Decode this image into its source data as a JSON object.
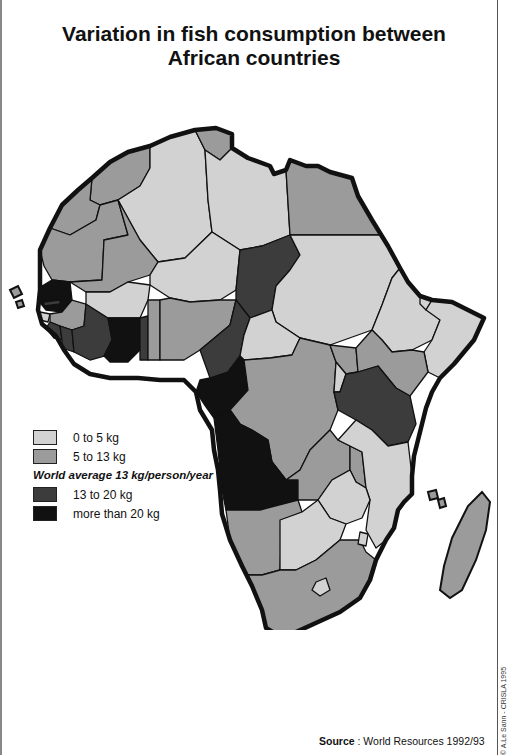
{
  "title": {
    "line1": "Variation in fish consumption between",
    "line2": "African countries"
  },
  "legend": {
    "items": [
      {
        "label": "0 to 5 kg",
        "category": "low",
        "color": "#d2d2d2"
      },
      {
        "label": "5 to 13 kg",
        "category": "mid",
        "color": "#9b9b9b"
      },
      {
        "label": "13 to 20 kg",
        "category": "high",
        "color": "#3c3c3c"
      },
      {
        "label": "more than 20 kg",
        "category": "very_high",
        "color": "#111111"
      }
    ],
    "world_average_note": "World average 13 kg/person/year"
  },
  "source": {
    "label": "Source",
    "text": " : World Resources 1992/93"
  },
  "credit": "© A.Le Sann - CRISLA 1995",
  "map": {
    "outline_color": "#111111",
    "regions": [
      {
        "name": "Morocco",
        "category": "mid"
      },
      {
        "name": "Algeria",
        "category": "low"
      },
      {
        "name": "Tunisia",
        "category": "mid"
      },
      {
        "name": "Libya",
        "category": "low"
      },
      {
        "name": "Egypt",
        "category": "mid"
      },
      {
        "name": "Western Sahara",
        "category": "mid"
      },
      {
        "name": "Mauritania",
        "category": "mid"
      },
      {
        "name": "Mali",
        "category": "mid"
      },
      {
        "name": "Niger",
        "category": "low"
      },
      {
        "name": "Chad",
        "category": "high"
      },
      {
        "name": "Sudan",
        "category": "low"
      },
      {
        "name": "Ethiopia",
        "category": "low"
      },
      {
        "name": "Djibouti",
        "category": "low"
      },
      {
        "name": "Somalia",
        "category": "low"
      },
      {
        "name": "Senegal",
        "category": "very_high"
      },
      {
        "name": "Gambia",
        "category": "high"
      },
      {
        "name": "Guinea-Bissau",
        "category": "low"
      },
      {
        "name": "Guinea",
        "category": "mid"
      },
      {
        "name": "Sierra Leone",
        "category": "high"
      },
      {
        "name": "Liberia",
        "category": "high"
      },
      {
        "name": "Ivory Coast",
        "category": "high"
      },
      {
        "name": "Burkina Faso",
        "category": "low"
      },
      {
        "name": "Ghana",
        "category": "very_high"
      },
      {
        "name": "Togo",
        "category": "high"
      },
      {
        "name": "Benin",
        "category": "mid"
      },
      {
        "name": "Nigeria",
        "category": "mid"
      },
      {
        "name": "Cameroon",
        "category": "high"
      },
      {
        "name": "Central African Republic",
        "category": "low"
      },
      {
        "name": "Gabon / Congo",
        "category": "very_high"
      },
      {
        "name": "Zaire",
        "category": "mid"
      },
      {
        "name": "Uganda",
        "category": "mid"
      },
      {
        "name": "Kenya",
        "category": "mid"
      },
      {
        "name": "Rwanda / Burundi",
        "category": "low"
      },
      {
        "name": "Tanzania",
        "category": "high"
      },
      {
        "name": "Angola",
        "category": "very_high"
      },
      {
        "name": "Zambia",
        "category": "mid"
      },
      {
        "name": "Malawi",
        "category": "mid"
      },
      {
        "name": "Mozambique",
        "category": "low"
      },
      {
        "name": "Zimbabwe",
        "category": "low"
      },
      {
        "name": "Namibia",
        "category": "mid"
      },
      {
        "name": "Botswana",
        "category": "low"
      },
      {
        "name": "South Africa",
        "category": "mid"
      },
      {
        "name": "Swaziland",
        "category": "low"
      },
      {
        "name": "Lesotho",
        "category": "low"
      },
      {
        "name": "Madagascar",
        "category": "mid"
      },
      {
        "name": "Cape Verde",
        "category": "mid"
      },
      {
        "name": "Comoros",
        "category": "mid"
      }
    ]
  }
}
